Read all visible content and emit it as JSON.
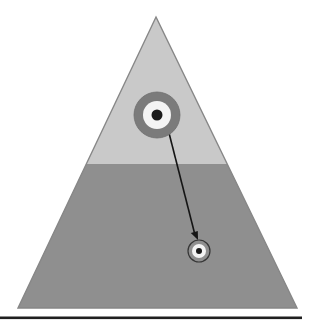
{
  "diagram": {
    "type": "pyramid-target-diagram",
    "colors": {
      "background": "#ffffff",
      "upper_section": "#c9c9c9",
      "lower_section": "#8f8f8f",
      "pyramid_outline": "#878787",
      "bullseye_ring": "#7b7b7b",
      "bullseye_inner": "#f4f4f4",
      "bullseye_dot": "#1b1b1b",
      "small_target_outline": "#363636",
      "small_target_inner": "#f4f4f4",
      "small_target_dot": "#1b1b1b",
      "arrow": "#151515",
      "bottom_bar": "#1f1f1f"
    },
    "geometry": {
      "pyramid_points": "156,17 297,308 18,308",
      "lower_section_points": "86.3,164 227.2,164 297,308 18,308",
      "big_target": {
        "cx": "157",
        "cy": "115",
        "outer_r": "23",
        "inner_r": "14",
        "dot_r": "5.5"
      },
      "small_target": {
        "cx": "199",
        "cy": "251",
        "outer_r": "11",
        "inner_r": "7",
        "dot_r": "3"
      },
      "arrow_line": {
        "x1": "169",
        "y1": "133",
        "x2": "194.5",
        "y2": "233"
      },
      "arrowhead_points": "198,240 190.8,232.9 197.8,231.1",
      "bottom_bar": {
        "x": "0",
        "y": "316.5",
        "width": "302",
        "height": "2.6"
      }
    }
  }
}
